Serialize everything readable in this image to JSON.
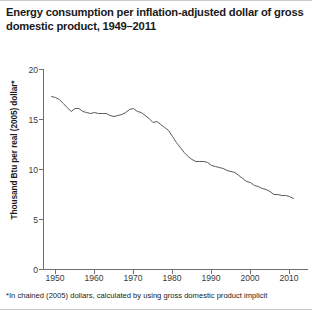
{
  "title": "Energy consumption per inflation-adjusted dollar of gross domestic product, 1949–2011",
  "footnote": "*In chained (2005) dollars, calculated by using gross domestic product implicit",
  "axis": {
    "ylabel": "Thousand Btu per real (2005) dollar*",
    "yticks": [
      "0",
      "5",
      "10",
      "15",
      "20"
    ],
    "xticks": [
      "1950",
      "1960",
      "1970",
      "1980",
      "1990",
      "2000",
      "2010"
    ]
  },
  "colors": {
    "line": "#58585a",
    "axis": "#6d6e71",
    "text": "#231f20",
    "background": "#ffffff"
  },
  "chart_data": {
    "type": "line",
    "title": "Energy consumption per inflation-adjusted dollar of gross domestic product, 1949–2011",
    "xlabel": "",
    "ylabel": "Thousand Btu per real (2005) dollar*",
    "xlim": [
      1949,
      2011
    ],
    "ylim": [
      0,
      20
    ],
    "grid": false,
    "legend": false,
    "xticks": [
      1950,
      1960,
      1970,
      1980,
      1990,
      2000,
      2010
    ],
    "yticks": [
      0,
      5,
      10,
      15,
      20
    ],
    "series": [
      {
        "name": "Energy intensity",
        "x": [
          1949,
          1950,
          1951,
          1952,
          1953,
          1954,
          1955,
          1956,
          1957,
          1958,
          1959,
          1960,
          1961,
          1962,
          1963,
          1964,
          1965,
          1966,
          1967,
          1968,
          1969,
          1970,
          1971,
          1972,
          1973,
          1974,
          1975,
          1976,
          1977,
          1978,
          1979,
          1980,
          1981,
          1982,
          1983,
          1984,
          1985,
          1986,
          1987,
          1988,
          1989,
          1990,
          1991,
          1992,
          1993,
          1994,
          1995,
          1996,
          1997,
          1998,
          1999,
          2000,
          2001,
          2002,
          2003,
          2004,
          2005,
          2006,
          2007,
          2008,
          2009,
          2010,
          2011
        ],
        "values": [
          17.3,
          17.2,
          17.0,
          16.6,
          16.2,
          15.8,
          16.1,
          16.1,
          15.8,
          15.7,
          15.6,
          15.7,
          15.6,
          15.6,
          15.6,
          15.4,
          15.3,
          15.4,
          15.5,
          15.7,
          16.0,
          16.1,
          15.8,
          15.7,
          15.4,
          15.1,
          14.7,
          14.8,
          14.5,
          14.2,
          13.9,
          13.3,
          12.7,
          12.2,
          11.7,
          11.3,
          11.0,
          10.8,
          10.8,
          10.8,
          10.7,
          10.4,
          10.3,
          10.2,
          10.1,
          9.9,
          9.8,
          9.7,
          9.4,
          9.1,
          8.8,
          8.7,
          8.4,
          8.3,
          8.1,
          8.0,
          7.8,
          7.5,
          7.5,
          7.4,
          7.4,
          7.3,
          7.1
        ]
      }
    ]
  }
}
